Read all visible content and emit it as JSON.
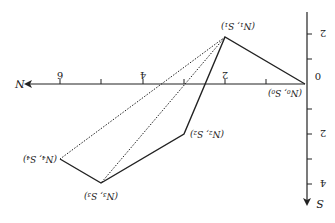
{
  "diagram": {
    "orientation": "rotated 180 degrees",
    "axes": {
      "horizontal_label": "N",
      "vertical_label": "S",
      "horizontal_ticks": [
        "2",
        "4",
        "6"
      ],
      "vertical_ticks": [
        "2",
        "2",
        "4"
      ],
      "origin_label": "0"
    },
    "points": [
      {
        "label": "(N₀, S₀)",
        "n": 0,
        "s": 0
      },
      {
        "label": "(N₁, S₁)",
        "n": 2,
        "s": -2
      },
      {
        "label": "(N₂, S₂)",
        "n": 3,
        "s": 2
      },
      {
        "label": "(N₃, S₃)",
        "n": 5,
        "s": 4
      },
      {
        "label": "(N₄, S₄)",
        "n": 6,
        "s": 3
      }
    ],
    "solid_path": [
      "P0",
      "P1",
      "P2",
      "P3",
      "P4"
    ],
    "dotted_lines": [
      [
        "P1",
        "P3"
      ],
      [
        "P1",
        "P4"
      ]
    ]
  }
}
